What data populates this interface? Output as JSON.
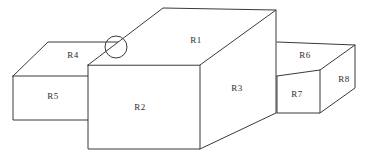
{
  "diagram": {
    "style": {
      "background_color": "#ffffff",
      "stroke_color": "#3a3a3a",
      "label_color": "#2e2e2e",
      "stroke_width": 1
    },
    "labels": [
      {
        "id": "R1",
        "text": "R1",
        "x": 196,
        "y": 41,
        "face": "top-face-main-block"
      },
      {
        "id": "R2",
        "text": "R2",
        "x": 140,
        "y": 108,
        "face": "front-face-main-block"
      },
      {
        "id": "R3",
        "text": "R3",
        "x": 237,
        "y": 89,
        "face": "right-face-main-block"
      },
      {
        "id": "R4",
        "text": "R4",
        "x": 73,
        "y": 56,
        "face": "top-face-left-block"
      },
      {
        "id": "R5",
        "text": "R5",
        "x": 53,
        "y": 97,
        "face": "front-face-left-block"
      },
      {
        "id": "R6",
        "text": "R6",
        "x": 305,
        "y": 56,
        "face": "top-face-right-block"
      },
      {
        "id": "R7",
        "text": "R7",
        "x": 297,
        "y": 95,
        "face": "front-face-right-block"
      },
      {
        "id": "R8",
        "text": "R8",
        "x": 344,
        "y": 80,
        "face": "right-face-right-block"
      }
    ],
    "shapes": {
      "left_block": {
        "top_face": "48,42 125,42 88,65 13,76",
        "front_face": "13,76 88,76 88,120 13,120",
        "edges": [
          "M 13,76 L 48,42 L 125,42",
          "M 13,76 L 13,120 L 88,120",
          "M 13,76 L 88,76"
        ]
      },
      "main_block": {
        "top_face": "163,8 276,10 200,65 88,65",
        "front_face": "88,65 200,65 200,149 88,149",
        "right_face": "200,65 276,10 276,113 200,149",
        "edges": [
          "M 88,65 L 163,8 L 276,10 L 200,65 Z",
          "M 88,65 L 88,149 L 200,149 L 200,65",
          "M 276,10 L 276,113",
          "M 200,149 L 276,113"
        ]
      },
      "right_block": {
        "top_face": "277,42 355,45 320,70 277,76",
        "front_face": "277,76 320,70 320,113 277,113",
        "right_face": "320,70 355,45 355,88 320,113",
        "edges": [
          "M 277,42 L 355,45 L 320,70 L 277,76",
          "M 277,76 L 277,113 L 320,113 L 320,70",
          "M 355,45 L 355,88 L 320,113"
        ]
      },
      "highlight": {
        "cx": 116,
        "cy": 47,
        "r": 11
      }
    }
  }
}
